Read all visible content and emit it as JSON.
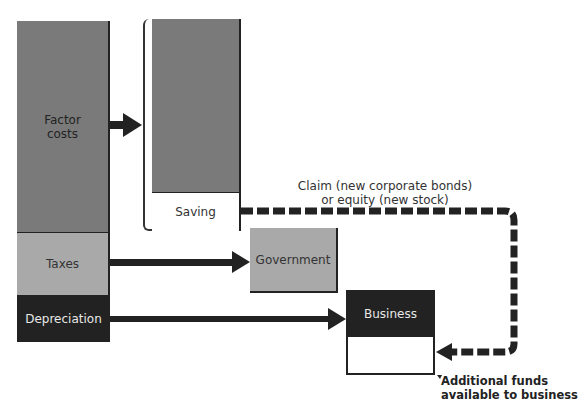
{
  "diagram": {
    "blocks": {
      "factor_costs": "Factor\ncosts",
      "taxes": "Taxes",
      "depreciation": "Depreciation",
      "saving": "Saving",
      "government": "Government",
      "business": "Business"
    },
    "labels": {
      "claim_line1": "Claim (new corporate bonds)",
      "claim_line2": "or equity (new stock)",
      "additional_line1": "Additional funds",
      "additional_line2": "available to business"
    },
    "colors": {
      "dark_gray": "#7a7a7a",
      "light_gray": "#a9a9a9",
      "black": "#222222",
      "white": "#ffffff"
    },
    "flows": [
      {
        "from": "Factor costs",
        "to": "Saving panel",
        "style": "solid"
      },
      {
        "from": "Taxes",
        "to": "Government",
        "style": "solid"
      },
      {
        "from": "Depreciation",
        "to": "Business",
        "style": "solid"
      },
      {
        "from": "Saving",
        "to": "Business (additional funds)",
        "style": "dashed"
      }
    ]
  }
}
